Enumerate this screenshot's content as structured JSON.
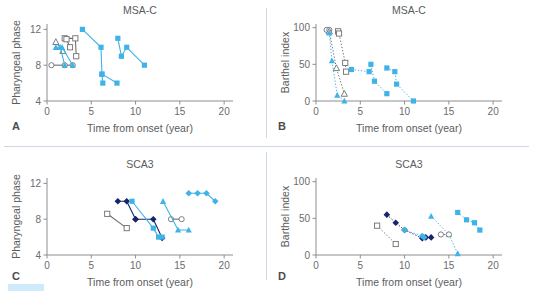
{
  "figure": {
    "panels": [
      {
        "letter": "A",
        "title": "MSA-C",
        "xlabel": "Time from onset  (year)",
        "ylabel": "Pharyngeal phase"
      },
      {
        "letter": "B",
        "title": "MSA-C",
        "xlabel": "Time from onset  (year)",
        "ylabel": "Barthel index"
      },
      {
        "letter": "C",
        "title": "SCA3",
        "xlabel": "Time from onset  (year)",
        "ylabel": "Pharyngeal phase"
      },
      {
        "letter": "D",
        "title": "SCA3",
        "xlabel": "Time from onset  (year)",
        "ylabel": "Barthel index"
      }
    ],
    "colors": {
      "light_blue": "#3fb3e8",
      "navy": "#17256b",
      "gray": "#6e6f71",
      "divider": "#cfd8e4",
      "swatch": "#cfeafb"
    }
  },
  "chart_data": [
    {
      "id": "A",
      "type": "line",
      "title": "MSA-C",
      "xlabel": "Time from onset  (year)",
      "ylabel": "Pharyngeal phase",
      "xlim": [
        0,
        21
      ],
      "ylim": [
        4,
        12.6
      ],
      "xticks": [
        0,
        5,
        10,
        15,
        20
      ],
      "yticks": [
        4,
        8,
        12
      ],
      "grid": false,
      "legend": "none",
      "series": [
        {
          "name": "open-triangle-line",
          "marker": "triangle-open",
          "color": "#6e6f71",
          "line": "solid",
          "points": [
            [
              1.0,
              10.6
            ],
            [
              1.8,
              9.6
            ]
          ]
        },
        {
          "name": "open-square-line-1",
          "marker": "square-open",
          "color": "#6e6f71",
          "line": "solid",
          "points": [
            [
              2.0,
              11.0
            ],
            [
              3.2,
              11.0
            ],
            [
              3.3,
              9.0
            ]
          ]
        },
        {
          "name": "open-square-line-2",
          "marker": "square-open",
          "color": "#6e6f71",
          "line": "solid",
          "points": [
            [
              2.2,
              10.9
            ],
            [
              2.6,
              10.0
            ]
          ]
        },
        {
          "name": "open-circle-line",
          "marker": "circle-open",
          "color": "#6e6f71",
          "line": "solid",
          "points": [
            [
              0.5,
              8.0
            ],
            [
              2.0,
              8.0
            ],
            [
              2.9,
              8.0
            ]
          ]
        },
        {
          "name": "blue-triangle-line-1",
          "marker": "triangle",
          "color": "#3fb3e8",
          "line": "solid",
          "points": [
            [
              1.0,
              10.0
            ],
            [
              1.5,
              10.0
            ],
            [
              2.0,
              8.0
            ]
          ]
        },
        {
          "name": "blue-triangle-line-2",
          "marker": "triangle",
          "color": "#3fb3e8",
          "line": "solid",
          "points": [
            [
              1.7,
              10.0
            ],
            [
              2.9,
              8.0
            ]
          ]
        },
        {
          "name": "blue-square-line-1",
          "marker": "square",
          "color": "#3fb3e8",
          "line": "solid",
          "points": [
            [
              4.0,
              12.0
            ],
            [
              6.1,
              10.0
            ],
            [
              6.2,
              7.0
            ],
            [
              6.3,
              6.0
            ]
          ]
        },
        {
          "name": "blue-square-line-2",
          "marker": "square",
          "color": "#3fb3e8",
          "line": "solid",
          "points": [
            [
              6.2,
              7.0
            ],
            [
              7.9,
              6.0
            ]
          ]
        },
        {
          "name": "blue-square-line-3",
          "marker": "square",
          "color": "#3fb3e8",
          "line": "solid",
          "points": [
            [
              8.0,
              11.0
            ],
            [
              8.4,
              9.0
            ],
            [
              9.0,
              10.0
            ],
            [
              11.0,
              8.0
            ]
          ]
        }
      ]
    },
    {
      "id": "B",
      "type": "line",
      "title": "MSA-C",
      "xlabel": "Time from onset  (year)",
      "ylabel": "Barthel index",
      "xlim": [
        0,
        21
      ],
      "ylim": [
        0,
        105
      ],
      "xticks": [
        0,
        5,
        10,
        15,
        20
      ],
      "yticks": [
        0,
        50,
        100
      ],
      "grid": false,
      "legend": "none",
      "series": [
        {
          "name": "open-circle-line",
          "marker": "circle-open",
          "color": "#6e6f71",
          "line": "dotted",
          "points": [
            [
              1.2,
              97
            ],
            [
              1.5,
              97
            ]
          ]
        },
        {
          "name": "open-triangle-line",
          "marker": "triangle-open",
          "color": "#6e6f71",
          "line": "dotted",
          "points": [
            [
              1.5,
              95
            ],
            [
              2.3,
              45
            ],
            [
              3.2,
              10
            ]
          ]
        },
        {
          "name": "open-square-line",
          "marker": "square-open",
          "color": "#6e6f71",
          "line": "dotted",
          "points": [
            [
              2.5,
              95
            ],
            [
              2.6,
              92
            ],
            [
              3.3,
              52
            ],
            [
              3.4,
              40
            ]
          ]
        },
        {
          "name": "blue-triangle-line",
          "marker": "triangle",
          "color": "#3fb3e8",
          "line": "dotted",
          "points": [
            [
              1.5,
              93
            ],
            [
              1.8,
              55
            ],
            [
              2.4,
              8
            ],
            [
              3.2,
              0
            ]
          ]
        },
        {
          "name": "blue-square-line-1",
          "marker": "square",
          "color": "#3fb3e8",
          "line": "dotted",
          "points": [
            [
              4.0,
              43
            ],
            [
              6.0,
              40
            ],
            [
              6.2,
              50
            ],
            [
              6.6,
              27
            ],
            [
              8.0,
              10
            ]
          ]
        },
        {
          "name": "blue-square-line-2",
          "marker": "square",
          "color": "#3fb3e8",
          "line": "dotted",
          "points": [
            [
              8.0,
              45
            ],
            [
              8.9,
              40
            ],
            [
              9.1,
              23
            ],
            [
              11.0,
              0
            ]
          ]
        }
      ]
    },
    {
      "id": "C",
      "type": "line",
      "title": "SCA3",
      "xlabel": "Time from onset  (year)",
      "ylabel": "Pharyngeal phase",
      "xlim": [
        0,
        21
      ],
      "ylim": [
        4,
        12.6
      ],
      "xticks": [
        0,
        5,
        10,
        15,
        20
      ],
      "yticks": [
        4,
        8,
        12
      ],
      "grid": false,
      "legend": "none",
      "series": [
        {
          "name": "open-square-line",
          "marker": "square-open",
          "color": "#6e6f71",
          "line": "solid",
          "points": [
            [
              6.8,
              8.6
            ],
            [
              9.0,
              7.0
            ]
          ]
        },
        {
          "name": "navy-diamond-line-1",
          "marker": "diamond",
          "color": "#17256b",
          "line": "solid",
          "points": [
            [
              8.0,
              10.0
            ],
            [
              9.0,
              10.0
            ],
            [
              10.0,
              8.0
            ]
          ]
        },
        {
          "name": "navy-diamond-line-2",
          "marker": "diamond",
          "color": "#17256b",
          "line": "solid",
          "points": [
            [
              10.0,
              8.0
            ],
            [
              12.0,
              8.0
            ],
            [
              13.0,
              5.9
            ]
          ]
        },
        {
          "name": "blue-square-line-1",
          "marker": "square",
          "color": "#3fb3e8",
          "line": "solid",
          "points": [
            [
              9.6,
              10.0
            ],
            [
              12.0,
              7.0
            ],
            [
              12.6,
              6.0
            ],
            [
              13.0,
              6.0
            ]
          ]
        },
        {
          "name": "open-circle-line",
          "marker": "circle-open",
          "color": "#6e6f71",
          "line": "solid",
          "points": [
            [
              14.0,
              8.0
            ],
            [
              15.2,
              8.0
            ]
          ]
        },
        {
          "name": "blue-triangle-line",
          "marker": "triangle",
          "color": "#3fb3e8",
          "line": "solid",
          "points": [
            [
              13.1,
              10.0
            ],
            [
              14.8,
              6.8
            ],
            [
              16.0,
              6.8
            ]
          ]
        },
        {
          "name": "blue-diamond-line",
          "marker": "diamond",
          "color": "#3fb3e8",
          "line": "solid",
          "points": [
            [
              16.0,
              10.9
            ],
            [
              17.0,
              10.9
            ],
            [
              18.0,
              10.9
            ],
            [
              19.0,
              10.0
            ]
          ]
        }
      ]
    },
    {
      "id": "D",
      "type": "line",
      "title": "SCA3",
      "xlabel": "Time from onset  (year)",
      "ylabel": "Barthel index",
      "xlim": [
        0,
        21
      ],
      "ylim": [
        0,
        105
      ],
      "xticks": [
        0,
        5,
        10,
        15,
        20
      ],
      "yticks": [
        0,
        50,
        100
      ],
      "grid": false,
      "legend": "none",
      "series": [
        {
          "name": "open-square-line",
          "marker": "square-open",
          "color": "#6e6f71",
          "line": "dotted",
          "points": [
            [
              6.9,
              40
            ],
            [
              9.0,
              15
            ]
          ]
        },
        {
          "name": "navy-diamond-line",
          "marker": "diamond",
          "color": "#17256b",
          "line": "dotted",
          "points": [
            [
              8.0,
              55
            ],
            [
              9.0,
              44
            ],
            [
              10.0,
              34
            ],
            [
              12.0,
              23
            ],
            [
              12.4,
              24
            ],
            [
              13.0,
              24
            ]
          ]
        },
        {
          "name": "blue-diamond-line-1",
          "marker": "diamond",
          "color": "#3fb3e8",
          "line": "dotted",
          "points": [
            [
              10.0,
              34
            ],
            [
              12.0,
              26
            ],
            [
              12.2,
              24
            ]
          ]
        },
        {
          "name": "blue-triangle-line",
          "marker": "triangle",
          "color": "#3fb3e8",
          "line": "dotted",
          "points": [
            [
              13.0,
              53
            ],
            [
              15.0,
              28
            ],
            [
              16.0,
              2
            ]
          ]
        },
        {
          "name": "open-circle-line",
          "marker": "circle-open",
          "color": "#6e6f71",
          "line": "dotted",
          "points": [
            [
              14.1,
              28
            ],
            [
              15.0,
              28
            ]
          ]
        },
        {
          "name": "blue-square-line",
          "marker": "square",
          "color": "#3fb3e8",
          "line": "dotted",
          "points": [
            [
              16.0,
              58
            ],
            [
              17.0,
              48
            ],
            [
              17.9,
              44
            ],
            [
              18.5,
              34
            ]
          ]
        }
      ]
    }
  ]
}
